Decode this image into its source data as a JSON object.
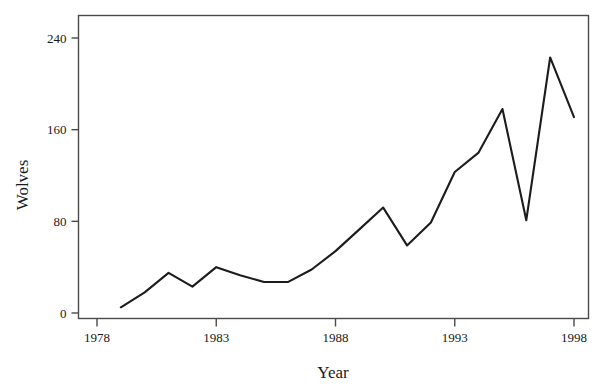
{
  "chart_data": {
    "type": "line",
    "title": "",
    "xlabel": "Year",
    "ylabel": "Wolves",
    "xlim": [
      1978,
      1998
    ],
    "ylim": [
      0,
      250
    ],
    "grid": false,
    "legend": null,
    "xticks": [
      1978,
      1983,
      1988,
      1993,
      1998
    ],
    "xtick_labels": [
      "1978",
      "1983",
      "1988",
      "1993",
      "1998"
    ],
    "yticks": [
      0,
      80,
      160,
      240
    ],
    "ytick_labels": [
      "0",
      "80",
      "160",
      "240"
    ],
    "series": [
      {
        "name": "Wolves",
        "color": "#1c1c1c",
        "x": [
          1979,
          1980,
          1981,
          1982,
          1983,
          1984,
          1985,
          1986,
          1987,
          1988,
          1989,
          1990,
          1991,
          1992,
          1993,
          1994,
          1995,
          1996,
          1997,
          1998
        ],
        "values": [
          5,
          18,
          35,
          23,
          40,
          33,
          27,
          27,
          38,
          54,
          73,
          92,
          59,
          79,
          123,
          140,
          178,
          81,
          223,
          171
        ]
      }
    ]
  },
  "axes": {
    "y_title": "Wolves",
    "x_title": "Year"
  }
}
